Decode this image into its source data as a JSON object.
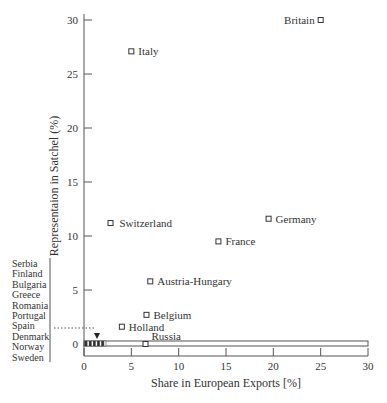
{
  "chart_data": {
    "type": "scatter",
    "title": "",
    "xlabel": "Share in European Exports [%]",
    "ylabel": "Representaion in Satchel (%)",
    "xlim": [
      0,
      30
    ],
    "ylim": [
      0,
      31
    ],
    "xticks": [
      "0",
      "5",
      "10",
      "15",
      "20",
      "25",
      "30"
    ],
    "yticks": [
      "0",
      "5",
      "10",
      "15",
      "20",
      "25",
      "30"
    ],
    "grid": false,
    "points": [
      {
        "label": "Britain",
        "x": 25.0,
        "y": 30.0
      },
      {
        "label": "Italy",
        "x": 5.0,
        "y": 27.1
      },
      {
        "label": "Switzerland",
        "x": 2.8,
        "y": 11.2
      },
      {
        "label": "Germany",
        "x": 19.5,
        "y": 11.6
      },
      {
        "label": "France",
        "x": 14.2,
        "y": 9.5
      },
      {
        "label": "Austria-Hungary",
        "x": 7.0,
        "y": 5.8
      },
      {
        "label": "Belgium",
        "x": 6.6,
        "y": 2.7
      },
      {
        "label": "Holland",
        "x": 4.0,
        "y": 1.6
      },
      {
        "label": "Russia",
        "x": 6.5,
        "y": 0.0
      }
    ],
    "cluster_at_zero": {
      "labels": [
        "Serbia",
        "Finland",
        "Bulgaria",
        "Greece",
        "Romania",
        "Portugal",
        "Spain",
        "Denmark",
        "Norway",
        "Sweden"
      ],
      "x_range": [
        0,
        2.2
      ],
      "y": 0,
      "annotation": "Spain marker arrow at x≈1.3"
    },
    "reference_line": {
      "y": 1.5,
      "style": "dotted",
      "x_from_px": 0,
      "x_to_px": 1.3
    }
  }
}
